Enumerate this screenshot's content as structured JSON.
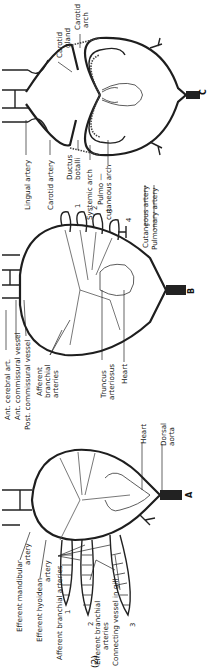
{
  "figure": {
    "panel_number": "(2)",
    "orientation": "rotated 90 degrees counterclockwise",
    "panels": [
      {
        "id": "A",
        "letter": "A",
        "labels": {
          "efferent_mandibular": "Efferent mandibular artery",
          "efferent_mandibular_l1": "Efferent mandibular",
          "efferent_mandibular_l2": "artery",
          "efferent_hyoidean_l1": "Efferent hyoidean",
          "efferent_hyoidean_l2": "artery",
          "afferent_branchial": "Afferent branchial arteries",
          "efferent_branchial_l1": "Efferent branchial",
          "efferent_branchial_l2": "arteries",
          "connecting_vessel": "Connecting vessel in gill",
          "heart": "Heart",
          "dorsal_aorta_l1": "Dorsal",
          "dorsal_aorta_l2": "aorta",
          "gill_numbers": [
            "1",
            "2",
            "3"
          ]
        }
      },
      {
        "id": "B",
        "letter": "B",
        "labels": {
          "ant_cerebral": "Ant. cerebral art.",
          "ant_commissural": "Ant. commissural vessel",
          "post_commissural": "Post. commissural vessel",
          "afferent_branchial_l1": "Afferent",
          "afferent_branchial_l2": "branchial",
          "afferent_branchial_l3": "arteries",
          "truncus_l1": "Truncus",
          "truncus_l2": "arteriosus",
          "heart": "Heart",
          "arch_numbers": [
            "1",
            "2",
            "3",
            "4"
          ]
        }
      },
      {
        "id": "C",
        "letter": "C",
        "labels": {
          "carotid_gland_l1": "Carotid",
          "carotid_gland_l2": "gland",
          "carotid_arch_l1": "Carotid",
          "carotid_arch_l2": "arch",
          "lingual_artery": "Lingual artery",
          "carotid_artery": "Carotid artery",
          "ductus_l1": "Ductus",
          "ductus_l2": "botalli",
          "systemic_arch": "Systemic arch",
          "pulmo_l1": "Pulmo —",
          "pulmo_l2": "cutaneous arch",
          "cutaneous_artery": "Cutaneous artery",
          "pulmonary_artery": "Pulmonary artery",
          "arch_numbers": [
            "1",
            "2",
            "3",
            "4"
          ]
        }
      }
    ]
  }
}
